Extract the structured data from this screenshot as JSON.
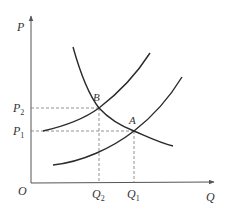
{
  "diagram": {
    "type": "supply-demand",
    "axes": {
      "y_label": "P",
      "x_label": "Q",
      "origin_label": "O"
    },
    "price_levels": [
      {
        "label": "P",
        "sub": "2",
        "y": 108
      },
      {
        "label": "P",
        "sub": "1",
        "y": 131
      }
    ],
    "quantity_levels": [
      {
        "label": "Q",
        "sub": "2",
        "x": 99
      },
      {
        "label": "Q",
        "sub": "1",
        "x": 134
      }
    ],
    "points": [
      {
        "label": "B",
        "x": 99,
        "y": 108
      },
      {
        "label": "A",
        "x": 134,
        "y": 131
      }
    ],
    "curves": [
      {
        "name": "demand",
        "shape": "downward-sloping convex"
      },
      {
        "name": "supply-1",
        "shape": "upward-sloping, passes through B"
      },
      {
        "name": "supply-2",
        "shape": "upward-sloping, passes through A"
      }
    ],
    "colors": {
      "curve": "#2a2a2a",
      "axis": "#555555",
      "dashed": "#777777",
      "text": "#333333"
    }
  }
}
